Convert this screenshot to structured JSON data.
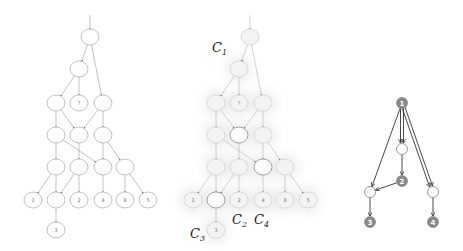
{
  "panels": [
    {
      "id": "left-graph",
      "offset_x": 0,
      "nodes": [
        {
          "id": "top",
          "x": 90,
          "y": 37,
          "label": ""
        },
        {
          "id": "l2",
          "x": 79,
          "y": 69,
          "label": ""
        },
        {
          "id": "l3a",
          "x": 56,
          "y": 103,
          "label": ""
        },
        {
          "id": "l3b",
          "x": 79,
          "y": 103,
          "label": "?"
        },
        {
          "id": "l3c",
          "x": 103,
          "y": 103,
          "label": ""
        },
        {
          "id": "l4a",
          "x": 56,
          "y": 135,
          "label": ""
        },
        {
          "id": "l4b",
          "x": 79,
          "y": 135,
          "label": ""
        },
        {
          "id": "l4c",
          "x": 103,
          "y": 135,
          "label": ""
        },
        {
          "id": "l5a",
          "x": 56,
          "y": 167,
          "label": ""
        },
        {
          "id": "l5b",
          "x": 79,
          "y": 167,
          "label": ""
        },
        {
          "id": "l5c",
          "x": 103,
          "y": 167,
          "label": ""
        },
        {
          "id": "l5d",
          "x": 125,
          "y": 167,
          "label": ""
        },
        {
          "id": "l6a",
          "x": 33,
          "y": 200,
          "label": "1"
        },
        {
          "id": "l6b",
          "x": 56,
          "y": 200,
          "label": ""
        },
        {
          "id": "l6c",
          "x": 79,
          "y": 200,
          "label": "2"
        },
        {
          "id": "l6d",
          "x": 103,
          "y": 200,
          "label": "4"
        },
        {
          "id": "l6e",
          "x": 125,
          "y": 200,
          "label": "8"
        },
        {
          "id": "l6f",
          "x": 148,
          "y": 200,
          "label": "5"
        },
        {
          "id": "l7a",
          "x": 56,
          "y": 230,
          "label": "3"
        }
      ],
      "edges": [
        [
          "top",
          "l2"
        ],
        [
          "top",
          "l3c"
        ],
        [
          "l2",
          "l3a"
        ],
        [
          "l2",
          "l3b"
        ],
        [
          "l3a",
          "l4a"
        ],
        [
          "l3a",
          "l4b"
        ],
        [
          "l3c",
          "l4b"
        ],
        [
          "l3c",
          "l4c"
        ],
        [
          "l4a",
          "l5a"
        ],
        [
          "l4a",
          "l5c"
        ],
        [
          "l4b",
          "l5b"
        ],
        [
          "l4c",
          "l5c"
        ],
        [
          "l4c",
          "l5d"
        ],
        [
          "l5a",
          "l6a"
        ],
        [
          "l5a",
          "l6b"
        ],
        [
          "l5b",
          "l6b"
        ],
        [
          "l5b",
          "l6c"
        ],
        [
          "l5c",
          "l6d"
        ],
        [
          "l5d",
          "l6e"
        ],
        [
          "l5d",
          "l6f"
        ],
        [
          "l6b",
          "l7a"
        ]
      ]
    },
    {
      "id": "middle-graph",
      "offset_x": 160,
      "highlighted_nodes": [
        "l4b",
        "l5c",
        "l6b"
      ],
      "cluster_labels": [
        {
          "name": "C",
          "sub": "1",
          "x": 212,
          "y": 52
        },
        {
          "name": "C",
          "sub": "2",
          "x": 232,
          "y": 224
        },
        {
          "name": "C",
          "sub": "4",
          "x": 254,
          "y": 224
        },
        {
          "name": "C",
          "sub": "3",
          "x": 190,
          "y": 238
        }
      ]
    },
    {
      "id": "right-graph",
      "nodes": [
        {
          "id": "n1",
          "x": 402,
          "y": 103,
          "label": "1",
          "filled": true
        },
        {
          "id": "w1",
          "x": 402,
          "y": 149,
          "label": "",
          "filled": false
        },
        {
          "id": "n2",
          "x": 402,
          "y": 181,
          "label": "2",
          "filled": true
        },
        {
          "id": "w2",
          "x": 370,
          "y": 192,
          "label": "",
          "filled": false
        },
        {
          "id": "w3",
          "x": 433,
          "y": 192,
          "label": "",
          "filled": false
        },
        {
          "id": "n3",
          "x": 370,
          "y": 222,
          "label": "3",
          "filled": true
        },
        {
          "id": "n4",
          "x": 433,
          "y": 222,
          "label": "4",
          "filled": true
        }
      ],
      "edges": [
        [
          "n1",
          "w2",
          0
        ],
        [
          "n1",
          "w1",
          -1.5
        ],
        [
          "n1",
          "w1",
          1.5
        ],
        [
          "n1",
          "w3",
          -1.5
        ],
        [
          "n1",
          "w3",
          1.5
        ],
        [
          "w1",
          "n2",
          0
        ],
        [
          "n2",
          "w2",
          0
        ],
        [
          "w2",
          "n3",
          0
        ],
        [
          "w3",
          "n4",
          0
        ]
      ]
    }
  ],
  "colors": {
    "edge_light": "#9a9a9a",
    "node_stroke": "#9a9a9a",
    "faded_stroke": "#c8c8c8",
    "shadow": "#e6e6e6",
    "right_edge": "#333333",
    "right_fill": "#8a8a8a"
  }
}
